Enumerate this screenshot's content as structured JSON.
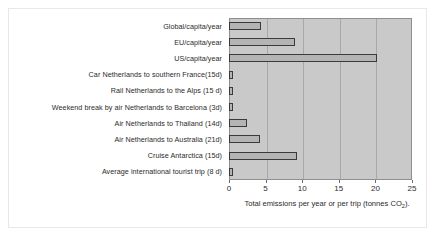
{
  "chart_data": {
    "type": "bar",
    "orientation": "horizontal",
    "title": "",
    "xlabel": "Total emissions per year or per trip (tonnes CO2).",
    "xlabel_main": "Total emissions per year or per trip (tonnes CO",
    "xlabel_sub": "2",
    "xlabel_tail": ").",
    "ylabel": "",
    "xlim": [
      0,
      25
    ],
    "xticks": [
      0,
      5,
      10,
      15,
      20,
      25
    ],
    "xticklabels": [
      "0",
      "5",
      "10",
      "15",
      "20",
      "25"
    ],
    "grid": "vertical",
    "legend": "none",
    "categories": [
      "Global/capita/year",
      "EU/capita/year",
      "US/capita/year",
      "Car Netherlands to southern France(15d)",
      "Rail Netherlands to the Alps (15 d)",
      "Weekend break by air Netherlands to Barcelona (3d)",
      "Air Netherlands to Thailand (14d)",
      "Air Netherlands to Australia (21d)",
      "Cruise Antarctica (15d)",
      "Average international tourist trip (8 d)"
    ],
    "values": [
      4.4,
      9.0,
      20.2,
      0.5,
      0.5,
      0.5,
      2.4,
      4.2,
      9.3,
      0.6
    ],
    "colors": {
      "bar_fill": "#b4b4b4",
      "bar_edge": "#3a3a3a",
      "plot_background": "#c9c9c9",
      "gridline": "#a8a8a8",
      "text": "#2b2b2b",
      "figure_background": "#ffffff"
    }
  }
}
